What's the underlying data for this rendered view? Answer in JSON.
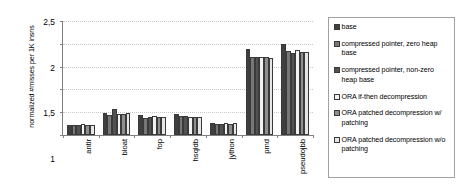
{
  "chart_data": {
    "type": "bar",
    "title": "",
    "xlabel": "",
    "ylabel": "normalized #misses per 1K insns",
    "ylim": [
      0,
      2.5
    ],
    "ytick_labels": [
      "0",
      "0,5",
      "1",
      "1,5",
      "2",
      "2,5"
    ],
    "ytick_values": [
      0,
      0.5,
      1,
      1.5,
      2,
      2.5
    ],
    "grid": true,
    "legend_position": "right",
    "categories": [
      "antlr",
      "bloat",
      "fop",
      "hsqldb",
      "jython",
      "pmd",
      "pseudojbb"
    ],
    "series": [
      {
        "name": "base",
        "color": "#3f3f3f",
        "values": [
          0.23,
          0.48,
          0.43,
          0.45,
          0.26,
          1.89,
          2.0
        ]
      },
      {
        "name": "compressed pointer, zero heap base",
        "color": "#777777",
        "values": [
          0.21,
          0.43,
          0.37,
          0.42,
          0.24,
          1.7,
          1.84
        ]
      },
      {
        "name": "compressed pointer, non-zero heap base",
        "color": "#525252",
        "values": [
          0.21,
          0.57,
          0.39,
          0.41,
          0.24,
          1.71,
          1.8
        ]
      },
      {
        "name": "ORA if-then decompression",
        "color": "#f2f2f2",
        "values": [
          0.24,
          0.46,
          0.41,
          0.39,
          0.27,
          1.71,
          1.87
        ]
      },
      {
        "name": "ORA patched decompression w/ patching",
        "color": "#8e8e8e",
        "values": [
          0.22,
          0.46,
          0.4,
          0.39,
          0.25,
          1.72,
          1.82
        ]
      },
      {
        "name": "ORA patched decompression w/o patching",
        "color": "#e6e6e6",
        "values": [
          0.22,
          0.49,
          0.4,
          0.39,
          0.27,
          1.69,
          1.83
        ]
      }
    ],
    "legend_entries": [
      {
        "label": "base",
        "color": "#3f3f3f"
      },
      {
        "label": "compressed pointer, zero heap base",
        "color": "#777777"
      },
      {
        "label": "compressed pointer, non-zero heap base",
        "color": "#525252"
      },
      {
        "label": "ORA if-then decompression",
        "color": "#f2f2f2"
      },
      {
        "label": "ORA patched decompression w/ patching",
        "color": "#8e8e8e"
      },
      {
        "label": "ORA patched decompression w/o patching",
        "color": "#e6e6e6"
      }
    ]
  }
}
